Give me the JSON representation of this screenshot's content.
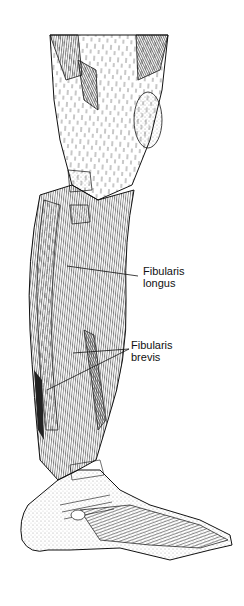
{
  "figure": {
    "background_color": "#ffffff",
    "ink_color": "#111111"
  },
  "labels": [
    {
      "id": "fibularis-longus",
      "line1": "Fibularis",
      "line2": "longus",
      "x": 143,
      "y": 266,
      "leaders": [
        {
          "x1": 138,
          "y1": 276,
          "x2": 67,
          "y2": 266
        }
      ]
    },
    {
      "id": "fibularis-brevis",
      "line1": "Fibularis",
      "line2": "brevis",
      "x": 131,
      "y": 340,
      "leaders": [
        {
          "x1": 129,
          "y1": 349,
          "x2": 73,
          "y2": 353
        },
        {
          "x1": 129,
          "y1": 349,
          "x2": 47,
          "y2": 390
        }
      ]
    }
  ]
}
